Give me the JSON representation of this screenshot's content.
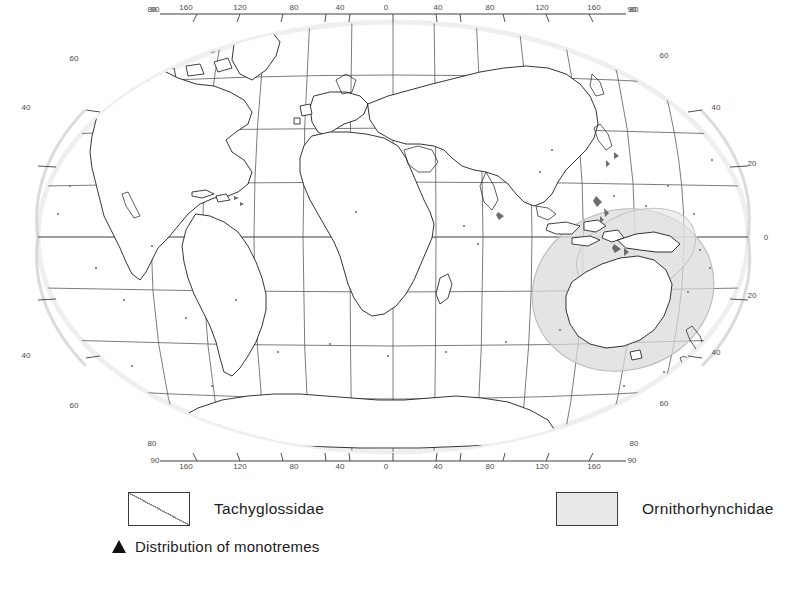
{
  "figure": {
    "type": "distribution-map",
    "title_visible": false,
    "projection": "pacific-centred elliptical (Mollweide-like) world projection",
    "background_color": "#ffffff",
    "ink_color": "#111111",
    "graticule_color": "#555a5e",
    "highlight_color": "#d9d9d9"
  },
  "map": {
    "longitude_axis": {
      "top_labels": [
        "90",
        "160",
        "120",
        "80",
        "40",
        "0",
        "40",
        "80",
        "120",
        "160",
        "90"
      ],
      "bottom_labels": [
        "90",
        "160",
        "120",
        "80",
        "40",
        "0",
        "40",
        "80",
        "120",
        "160",
        "90"
      ],
      "units": "degrees",
      "center_meridian": "0"
    },
    "latitude_axis": {
      "left_labels": [
        "80",
        "60",
        "40",
        "40",
        "60",
        "80"
      ],
      "right_labels": [
        "80",
        "60",
        "40",
        "20",
        "0",
        "20",
        "40",
        "60",
        "80"
      ],
      "units": "degrees"
    },
    "graticule": {
      "parallel_spacing": "20",
      "meridian_spacing": "20",
      "visible": true
    },
    "highlight_regions": [
      {
        "name": "australia-new-guinea-monotreme-range",
        "label": "Distribution of monotremes",
        "shape": "ellipse",
        "fill": "#d9d9d9"
      }
    ]
  },
  "legend": {
    "items": [
      {
        "key": "tachyglossidae",
        "label": "Tachyglossidae",
        "swatch": "white-box-with-diagonal-hatch",
        "fill": "#ffffff"
      },
      {
        "key": "ornithorhynchidae",
        "label": "Ornithorhynchidae",
        "swatch": "solid-grey-box",
        "fill": "#e9e9e9"
      }
    ],
    "note": {
      "marker": "filled-triangle",
      "label": "Distribution of monotremes"
    }
  }
}
